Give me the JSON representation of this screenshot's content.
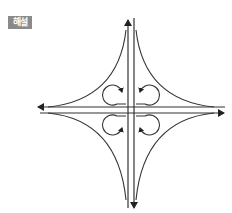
{
  "header": {
    "label": "해설",
    "label_bg_color": "#8a8a8a",
    "label_text_color": "#ffffff"
  },
  "diagram": {
    "type": "cloverleaf-interchange",
    "line_color": "#333333",
    "arms": [
      {
        "direction": "up",
        "arrow": true
      },
      {
        "direction": "down",
        "arrow": true
      },
      {
        "direction": "left",
        "arrow": true
      },
      {
        "direction": "right",
        "arrow": true
      }
    ],
    "loop_ramps": 4,
    "flare_curves": 4
  }
}
